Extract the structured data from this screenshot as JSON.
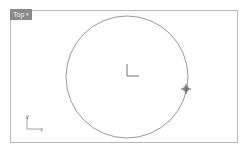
{
  "viewport": {
    "title": "Top",
    "dropdown_glyph": "▾"
  },
  "canvas": {
    "circle": {
      "cx": 127,
      "cy": 77,
      "r": 61,
      "stroke": "#8c8c8c"
    },
    "origin_marker": {
      "x": 127,
      "y": 76
    },
    "cursor": {
      "x": 186,
      "y": 89
    }
  },
  "world_axes": {
    "x_label": "x",
    "y_label": "y"
  },
  "colors": {
    "tab_bg": "#8a8a8a",
    "border": "#b8b8b8",
    "axis": "#8c8c8c"
  }
}
